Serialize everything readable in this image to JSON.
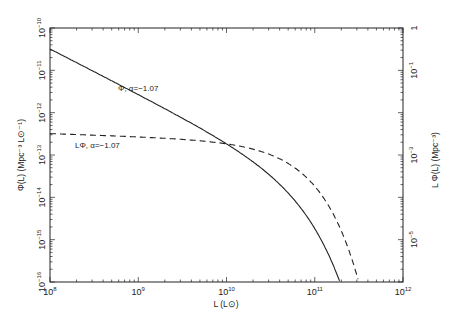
{
  "chart_data": {
    "type": "line",
    "title": "",
    "xlabel": "L (L⊙)",
    "ylabel": "Φ(L) (Mpc⁻³ L⊙⁻¹)",
    "ylabel_right": "L Φ(L) (Mpc⁻³)",
    "xscale": "log",
    "yscale": "log",
    "xlim": [
      100000000.0,
      1000000000000.0
    ],
    "ylim": [
      1e-16,
      1e-10
    ],
    "ylim_right": [
      1e-06,
      1
    ],
    "grid": false,
    "legend": "none (inline annotations)",
    "x_ticks": [
      "10^8",
      "10^9",
      "10^10",
      "10^11",
      "10^12"
    ],
    "y_ticks_left": [
      "10^-16",
      "10^-15",
      "10^-14",
      "10^-13",
      "10^-12",
      "10^-11",
      "10^-10"
    ],
    "y_ticks_right": [
      "10^-5",
      "10^-3",
      "10^-1",
      "1"
    ],
    "series": [
      {
        "name": "Φ, α=−1.07",
        "style": "solid",
        "axis": "left",
        "x": [
          100000000.0,
          300000000.0,
          1000000000.0,
          3000000000.0,
          10000000000.0,
          20000000000.0,
          40000000000.0,
          60000000000.0,
          100000000000.0,
          150000000000.0,
          200000000000.0
        ],
        "y": [
          3.2e-11,
          1e-11,
          2.8e-12,
          8.5e-13,
          2.1e-13,
          8.3e-14,
          2.4e-14,
          8e-15,
          1.1e-15,
          1e-16,
          1e-17
        ]
      },
      {
        "name": "LΦ, α=−1.07",
        "style": "dashed",
        "axis": "right",
        "x": [
          100000000.0,
          300000000.0,
          1000000000.0,
          3000000000.0,
          10000000000.0,
          20000000000.0,
          40000000000.0,
          60000000000.0,
          100000000000.0,
          150000000000.0,
          200000000000.0,
          300000000000.0,
          340000000000.0
        ],
        "y": [
          0.0032,
          0.003,
          0.0028,
          0.00255,
          0.0021,
          0.00166,
          0.00096,
          0.00048,
          0.00011,
          1.5e-05,
          2e-06,
          3e-07,
          1e-07
        ]
      }
    ],
    "annotations": [
      {
        "text": "Φ, α=−1.07",
        "near_series": 0
      },
      {
        "text": "LΦ, α=−1.07",
        "near_series": 1
      }
    ]
  },
  "labels": {
    "x_axis_title": "L (L⊙)",
    "y_axis_left_title": "Φ(L) (Mpc⁻³ L⊙⁻¹)",
    "y_axis_right_title": "L Φ(L) (Mpc⁻³)",
    "annot_phi": "Φ, α=−1.07",
    "annot_lphi": "LΦ, α=−1.07"
  }
}
